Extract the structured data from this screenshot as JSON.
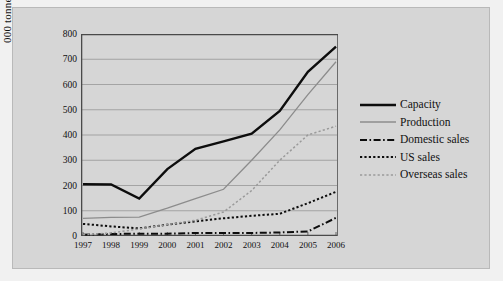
{
  "chart_data": {
    "type": "line",
    "title": "",
    "xlabel": "",
    "ylabel": "000 tonnes",
    "categories": [
      "1997",
      "1998",
      "1999",
      "2000",
      "2001",
      "2002",
      "2003",
      "2004",
      "2005",
      "2006"
    ],
    "x": [
      1997,
      1998,
      1999,
      2000,
      2001,
      2002,
      2003,
      2004,
      2005,
      2006
    ],
    "ylim": [
      0,
      800
    ],
    "ytick_labels": [
      "0",
      "100",
      "200",
      "300",
      "400",
      "500",
      "600",
      "700",
      "800"
    ],
    "ytick_values": [
      0,
      100,
      200,
      300,
      400,
      500,
      600,
      700,
      800
    ],
    "grid": true,
    "legend_position": "right",
    "series": [
      {
        "name": "Capacity",
        "style": "solid-thick",
        "color": "#0d0d0d",
        "values": [
          205,
          204,
          148,
          265,
          345,
          375,
          405,
          495,
          650,
          750
        ]
      },
      {
        "name": "Production",
        "style": "solid-thin",
        "color": "#8c8c8c",
        "values": [
          70,
          74,
          75,
          110,
          148,
          185,
          300,
          420,
          560,
          690
        ]
      },
      {
        "name": "Domestic sales",
        "style": "dash-dot",
        "color": "#0d0d0d",
        "values": [
          5,
          8,
          9,
          9,
          12,
          12,
          12,
          14,
          18,
          72
        ]
      },
      {
        "name": "US sales",
        "style": "dotted",
        "color": "#0d0d0d",
        "values": [
          48,
          38,
          30,
          45,
          58,
          70,
          80,
          88,
          130,
          175
        ]
      },
      {
        "name": "Overseas sales",
        "style": "dotted-light",
        "color": "#9a9a9a",
        "values": [
          5,
          12,
          28,
          45,
          62,
          95,
          180,
          300,
          400,
          435
        ]
      }
    ]
  },
  "legend": {
    "items": [
      {
        "label": "Capacity"
      },
      {
        "label": "Production"
      },
      {
        "label": "Domestic sales"
      },
      {
        "label": "US sales"
      },
      {
        "label": "Overseas sales"
      }
    ]
  }
}
